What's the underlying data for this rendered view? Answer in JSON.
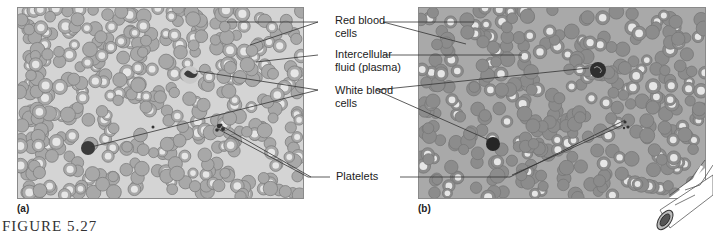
{
  "figure": {
    "caption": "FIGURE 5.27",
    "panels": [
      {
        "id": "a",
        "label": "(a)",
        "type": "illustration"
      },
      {
        "id": "b",
        "label": "(b)",
        "type": "micrograph"
      }
    ],
    "labels": [
      {
        "key": "red_blood_cells",
        "line1": "Red blood",
        "line2": "cells"
      },
      {
        "key": "intercellular_fluid",
        "line1": "Intercellular",
        "line2": "fluid (plasma)"
      },
      {
        "key": "white_blood_cells",
        "line1": "White blood",
        "line2": "cells"
      },
      {
        "key": "platelets",
        "line1": "Platelets",
        "line2": ""
      }
    ]
  },
  "colors": {
    "panel_a_bg": "#d4d4d4",
    "panel_b_bg": "#a9a9a9",
    "rbc_a": "#a8a8a8",
    "rbc_b": "#8c8c8c",
    "wbc": "#3a3a3a",
    "leader_line": "#333333"
  }
}
